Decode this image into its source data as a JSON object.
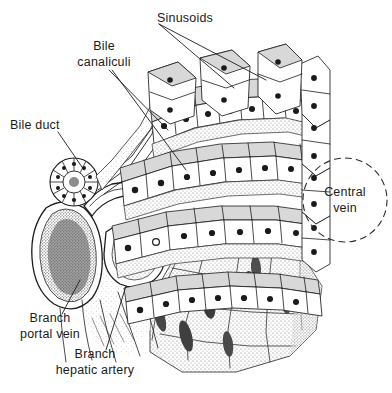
{
  "figure": {
    "medium": "pen-and-ink anatomical line drawing with stipple shading",
    "background_color": "#ffffff",
    "ink_color": "#1d1d1d",
    "label_color": "#1b1b1b",
    "width": 392,
    "height": 393
  },
  "labels": [
    {
      "id": "sinusoids",
      "text": "Sinusoids",
      "x": 157,
      "y": 18,
      "anchor": "start",
      "lines": [
        "Sinusoids"
      ],
      "leader_count": 2
    },
    {
      "id": "bile-canaliculi",
      "text": "Bile canaliculi",
      "x": 104,
      "y": 61,
      "anchor": "middle",
      "lines": [
        "Bile",
        "canaliculi"
      ],
      "leader_count": 2
    },
    {
      "id": "bile-duct",
      "text": "Bile duct",
      "x": 10,
      "y": 129,
      "anchor": "start",
      "lines": [
        "Bile duct"
      ],
      "leader_count": 1
    },
    {
      "id": "central-vein",
      "text": "Central vein",
      "x": 345,
      "y": 196,
      "anchor": "middle",
      "lines": [
        "Central",
        "vein"
      ],
      "leader_count": 0
    },
    {
      "id": "branch-portal-vein",
      "text": "Branch portal vein",
      "x": 50,
      "y": 322,
      "anchor": "middle",
      "lines": [
        "Branch",
        "portal vein"
      ],
      "leader_count": 1
    },
    {
      "id": "branch-hepatic-artery",
      "text": "Branch hepatic artery",
      "x": 95,
      "y": 358,
      "anchor": "middle",
      "lines": [
        "Branch",
        "hepatic artery"
      ],
      "leader_count": 1
    }
  ],
  "annotations": {
    "central_vein_marker": {
      "shape": "dashed-circle",
      "cx": 345,
      "cy": 200,
      "r": 42,
      "color": "#2a2a2a"
    }
  },
  "structures": [
    {
      "name": "hepatic-cell-plate",
      "description": "radiating cords of cuboidal hepatocytes with dark round nuclei"
    },
    {
      "name": "sinusoid-band",
      "description": "stippled blood channels between hepatocyte plates"
    },
    {
      "name": "bile-duct-rosette",
      "description": "radial ring of cuboidal duct cells at left"
    },
    {
      "name": "portal-vein-branch",
      "description": "large kidney-shaped vessel with stippled wall at lower left"
    },
    {
      "name": "hepatic-artery-branch",
      "description": "small thick-walled vessel below the portal vein"
    },
    {
      "name": "bile-canaliculus",
      "description": "fine parallel channels running between hepatocyte rows"
    },
    {
      "name": "lobule-cut-surface",
      "description": "stippled polygonal surface with dark sinusoid openings at lower right"
    }
  ]
}
